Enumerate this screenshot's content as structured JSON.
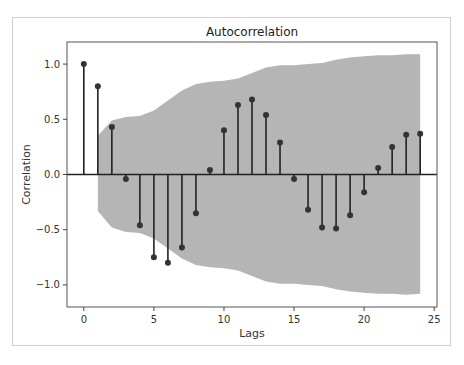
{
  "chart_data": {
    "type": "stem",
    "title": "Autocorrelation",
    "xlabel": "Lags",
    "ylabel": "Correlation",
    "xlim": [
      -1.2,
      25.2
    ],
    "ylim": [
      -1.2,
      1.2
    ],
    "xticks": [
      0,
      5,
      10,
      15,
      20,
      25
    ],
    "yticks": [
      -1.0,
      -0.5,
      0.0,
      0.5,
      1.0
    ],
    "ytick_labels": [
      "−1.0",
      "−0.5",
      "0.0",
      "0.5",
      "1.0"
    ],
    "grid": false,
    "lags": [
      0,
      1,
      2,
      3,
      4,
      5,
      6,
      7,
      8,
      9,
      10,
      11,
      12,
      13,
      14,
      15,
      16,
      17,
      18,
      19,
      20,
      21,
      22,
      23,
      24
    ],
    "values": [
      1.0,
      0.8,
      0.43,
      -0.04,
      -0.46,
      -0.75,
      -0.8,
      -0.66,
      -0.35,
      0.04,
      0.4,
      0.63,
      0.68,
      0.54,
      0.29,
      -0.04,
      -0.32,
      -0.48,
      -0.49,
      -0.37,
      -0.16,
      0.06,
      0.25,
      0.36,
      0.37
    ],
    "confidence_band": {
      "lags": [
        1,
        2,
        3,
        4,
        5,
        6,
        7,
        8,
        9,
        10,
        11,
        12,
        13,
        14,
        15,
        16,
        17,
        18,
        19,
        20,
        21,
        22,
        23,
        24
      ],
      "upper": [
        0.35,
        0.49,
        0.52,
        0.53,
        0.58,
        0.67,
        0.76,
        0.82,
        0.84,
        0.85,
        0.87,
        0.92,
        0.97,
        0.99,
        0.99,
        1.0,
        1.01,
        1.04,
        1.06,
        1.07,
        1.08,
        1.08,
        1.09,
        1.09
      ],
      "lower": [
        -0.33,
        -0.48,
        -0.52,
        -0.53,
        -0.58,
        -0.67,
        -0.76,
        -0.82,
        -0.84,
        -0.85,
        -0.87,
        -0.92,
        -0.97,
        -0.99,
        -0.99,
        -1.0,
        -1.01,
        -1.04,
        -1.06,
        -1.07,
        -1.08,
        -1.08,
        -1.09,
        -1.08
      ],
      "color": "#b5b5b5"
    },
    "stem_color": "#222222",
    "marker_color": "#333333"
  },
  "caption": ""
}
